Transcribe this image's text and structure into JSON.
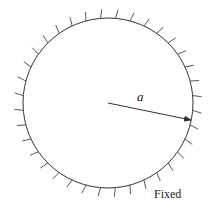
{
  "diagram": {
    "circle": {
      "cx": 108,
      "cy": 103,
      "r": 85,
      "stroke": "#333333"
    },
    "hatch": {
      "count": 36,
      "length": 9,
      "tilt_deg": 12,
      "offset_deg": 5
    },
    "radius_arrow": {
      "from": [
        108,
        103
      ],
      "to": [
        191,
        120
      ]
    },
    "labels": {
      "radius": "a",
      "boundary": "Fixed"
    }
  }
}
